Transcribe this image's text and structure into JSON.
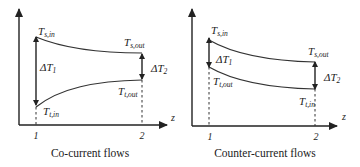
{
  "diagrams": [
    {
      "id": "co-current",
      "caption": "Co-current flows",
      "axis_label_z": "z",
      "tick_1": "1",
      "tick_2": "2",
      "labels": {
        "ts_in_main": "T",
        "ts_in_sub": "s,in",
        "ts_out_main": "T",
        "ts_out_sub": "s,out",
        "tt_in_main": "T",
        "tt_in_sub": "t,in",
        "tt_out_main": "T",
        "tt_out_sub": "t,out",
        "dt1_main": "ΔT",
        "dt1_sub": "1",
        "dt2_main": "ΔT",
        "dt2_sub": "2"
      }
    },
    {
      "id": "counter-current",
      "caption": "Counter-current flows",
      "axis_label_z": "z",
      "tick_1": "1",
      "tick_2": "2",
      "labels": {
        "ts_in_main": "T",
        "ts_in_sub": "s,in",
        "ts_out_main": "T",
        "ts_out_sub": "s,out",
        "tt_out_main": "T",
        "tt_out_sub": "t,out",
        "tt_in_main": "T",
        "tt_in_sub": "t,in",
        "dt1_main": "ΔT",
        "dt1_sub": "1",
        "dt2_main": "ΔT",
        "dt2_sub": "2"
      }
    }
  ],
  "colors": {
    "line": "#222222",
    "background": "#ffffff"
  }
}
